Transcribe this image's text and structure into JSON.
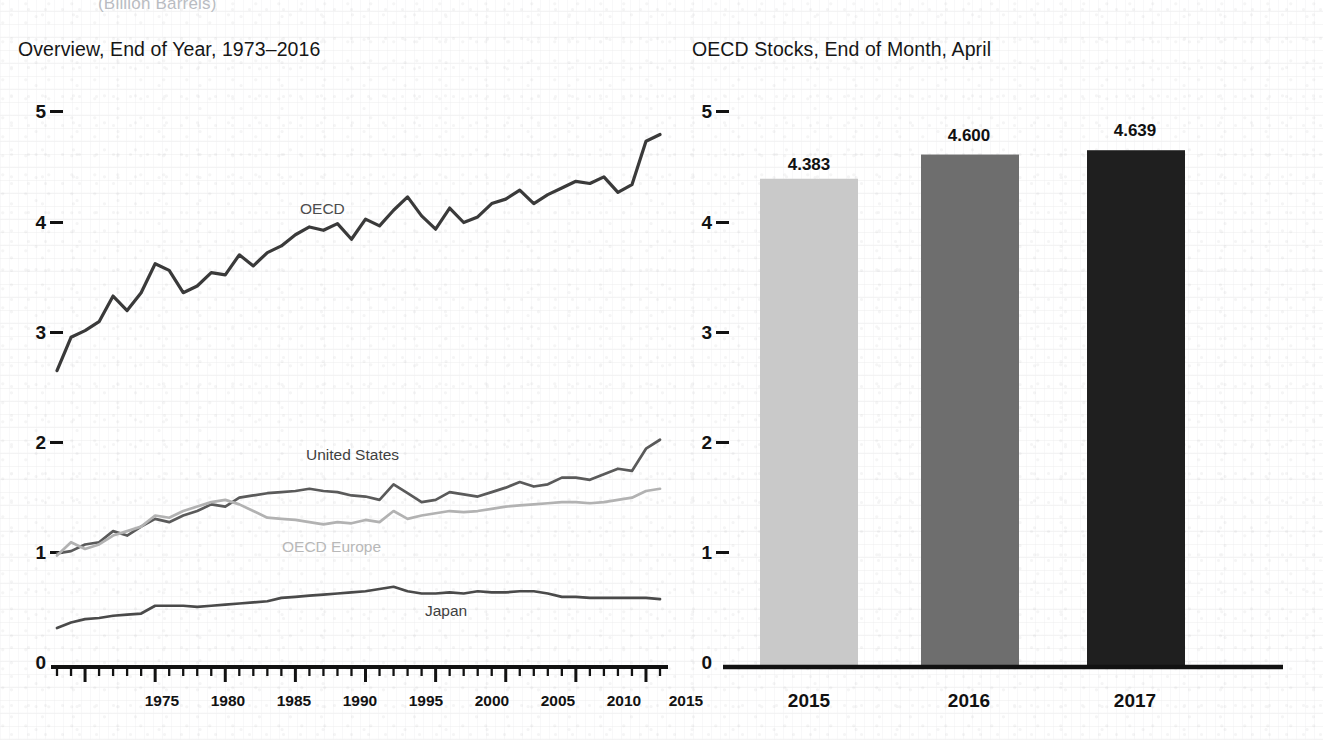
{
  "page": {
    "cut_off_header": "(Billion Barrels)"
  },
  "left_panel": {
    "title": "Overview, End of Year, 1973–2016",
    "y_ticks": [
      "5",
      "4",
      "3",
      "2",
      "1",
      "0"
    ],
    "x_ticks": [
      "1975",
      "1980",
      "1985",
      "1990",
      "1995",
      "2000",
      "2005",
      "2010",
      "2015"
    ],
    "series_labels": {
      "oecd": "OECD",
      "united_states": "United States",
      "oecd_europe": "OECD Europe",
      "japan": "Japan"
    },
    "colors": {
      "oecd": "#3a3a3a",
      "united_states": "#5a5a5a",
      "oecd_europe": "#b2b2b2",
      "japan": "#4a4a4a",
      "axis": "#121212"
    }
  },
  "right_panel": {
    "title": "OECD Stocks, End of Month, April",
    "y_ticks": [
      "5",
      "4",
      "3",
      "2",
      "1",
      "0"
    ],
    "bar_labels": [
      "2015",
      "2016",
      "2017"
    ],
    "bar_values": [
      "4.383",
      "4.600",
      "4.639"
    ],
    "colors": {
      "bar_2015": "#c9c9c9",
      "bar_2016": "#6e6e6e",
      "bar_2017": "#1f1f1f",
      "axis": "#121212"
    }
  },
  "chart_data": [
    {
      "type": "line",
      "title": "Overview, End of Year, 1973–2016",
      "xlabel": "",
      "ylabel": "",
      "xlim": [
        1973,
        2016
      ],
      "ylim": [
        0,
        5.4
      ],
      "grid": false,
      "legend": "inline-labels",
      "x": [
        1973,
        1974,
        1975,
        1976,
        1977,
        1978,
        1979,
        1980,
        1981,
        1982,
        1983,
        1984,
        1985,
        1986,
        1987,
        1988,
        1989,
        1990,
        1991,
        1992,
        1993,
        1994,
        1995,
        1996,
        1997,
        1998,
        1999,
        2000,
        2001,
        2002,
        2003,
        2004,
        2005,
        2006,
        2007,
        2008,
        2009,
        2010,
        2011,
        2012,
        2013,
        2014,
        2015,
        2016
      ],
      "series": [
        {
          "name": "OECD",
          "color": "#3a3a3a",
          "values": [
            2.66,
            2.96,
            3.02,
            3.1,
            3.33,
            3.2,
            3.36,
            3.62,
            3.56,
            3.36,
            3.42,
            3.54,
            3.52,
            3.7,
            3.6,
            3.72,
            3.78,
            3.88,
            3.95,
            3.92,
            3.98,
            3.84,
            4.02,
            3.96,
            4.1,
            4.22,
            4.05,
            3.93,
            4.12,
            3.99,
            4.04,
            4.16,
            4.2,
            4.28,
            4.16,
            4.24,
            4.3,
            4.36,
            4.34,
            4.4,
            4.26,
            4.33,
            4.72,
            4.78
          ]
        },
        {
          "name": "United States",
          "color": "#5a5a5a",
          "values": [
            1.02,
            1.04,
            1.1,
            1.12,
            1.22,
            1.18,
            1.26,
            1.33,
            1.3,
            1.36,
            1.4,
            1.46,
            1.44,
            1.52,
            1.54,
            1.56,
            1.57,
            1.58,
            1.6,
            1.58,
            1.57,
            1.54,
            1.53,
            1.5,
            1.64,
            1.56,
            1.48,
            1.5,
            1.57,
            1.55,
            1.53,
            1.57,
            1.61,
            1.66,
            1.62,
            1.64,
            1.7,
            1.7,
            1.68,
            1.73,
            1.78,
            1.76,
            1.96,
            2.04
          ]
        },
        {
          "name": "OECD Europe",
          "color": "#b2b2b2",
          "values": [
            1.0,
            1.12,
            1.06,
            1.1,
            1.18,
            1.22,
            1.26,
            1.36,
            1.34,
            1.4,
            1.44,
            1.48,
            1.5,
            1.46,
            1.4,
            1.34,
            1.33,
            1.32,
            1.3,
            1.28,
            1.3,
            1.29,
            1.32,
            1.3,
            1.4,
            1.33,
            1.36,
            1.38,
            1.4,
            1.39,
            1.4,
            1.42,
            1.44,
            1.45,
            1.46,
            1.47,
            1.48,
            1.48,
            1.47,
            1.48,
            1.5,
            1.52,
            1.58,
            1.6
          ]
        },
        {
          "name": "Japan",
          "color": "#4a4a4a",
          "values": [
            0.35,
            0.4,
            0.43,
            0.44,
            0.46,
            0.47,
            0.48,
            0.55,
            0.55,
            0.55,
            0.54,
            0.55,
            0.56,
            0.57,
            0.58,
            0.59,
            0.62,
            0.63,
            0.64,
            0.65,
            0.66,
            0.67,
            0.68,
            0.7,
            0.72,
            0.68,
            0.66,
            0.66,
            0.67,
            0.66,
            0.68,
            0.67,
            0.67,
            0.68,
            0.68,
            0.66,
            0.63,
            0.63,
            0.62,
            0.62,
            0.62,
            0.62,
            0.62,
            0.61
          ]
        }
      ]
    },
    {
      "type": "bar",
      "title": "OECD Stocks, End of Month, April",
      "categories": [
        "2015",
        "2016",
        "2017"
      ],
      "values": [
        4.383,
        4.6,
        4.639
      ],
      "data_labels": [
        "4.383",
        "4.600",
        "4.639"
      ],
      "colors": [
        "#c9c9c9",
        "#6e6e6e",
        "#1f1f1f"
      ],
      "xlabel": "",
      "ylabel": "",
      "ylim": [
        0,
        5.4
      ],
      "grid": false,
      "legend": "none"
    }
  ]
}
